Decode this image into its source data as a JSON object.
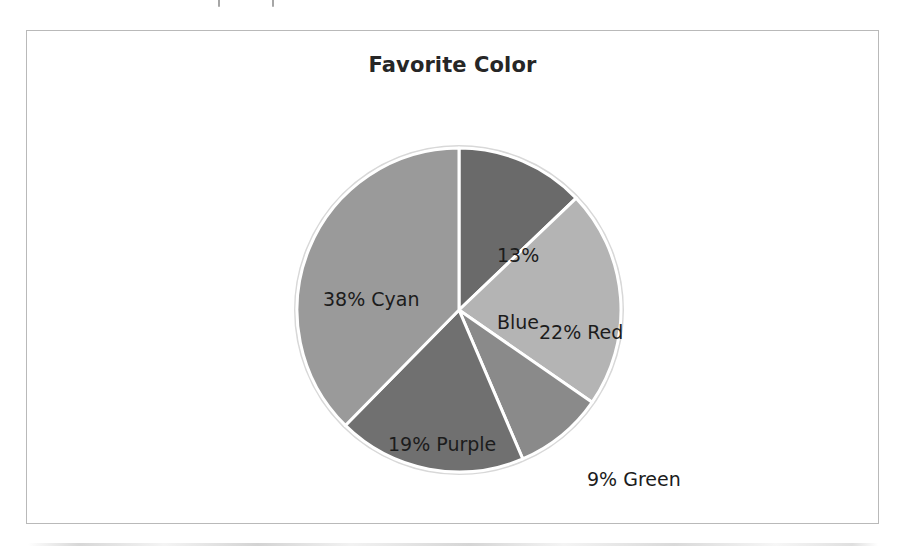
{
  "chart_data": {
    "type": "pie",
    "title": "Favorite Color",
    "categories": [
      "Blue",
      "Red",
      "Green",
      "Purple",
      "Cyan"
    ],
    "values": [
      13,
      22,
      9,
      19,
      38
    ],
    "value_unit": "%",
    "labels": [
      "13%\nBlue",
      "22% Red",
      "9% Green",
      "19% Purple",
      "38% Cyan"
    ],
    "slice_colors": [
      "#6a6a6a",
      "#b4b4b4",
      "#8a8a8a",
      "#707070",
      "#9a9a9a"
    ],
    "slice_border_color": "#ffffff",
    "start_angle_deg": 0,
    "direction": "clockwise",
    "legend": "none",
    "grid": false,
    "xlabel": "",
    "ylabel": ""
  },
  "chart": {
    "title": "Favorite Color",
    "frame_border_color": "#b9b9b9",
    "background": "#ffffff"
  },
  "labels": {
    "blue_line1": "13%",
    "blue_line2": "Blue",
    "red": "22% Red",
    "green": "9% Green",
    "purple": "19% Purple",
    "cyan": "38% Cyan"
  }
}
